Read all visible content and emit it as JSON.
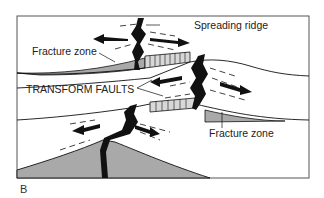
{
  "figure": {
    "panel_label": "B",
    "labels": {
      "spreading_ridge": "Spreading ridge",
      "fracture_zone_top": "Fracture zone",
      "transform_faults": "TRANSFORM FAULTS",
      "fracture_zone_bottom": "Fracture zone"
    },
    "colors": {
      "fill_gray": "#a9a9a9",
      "ink": "#111111",
      "frame": "#555555",
      "background": "#ffffff"
    }
  }
}
